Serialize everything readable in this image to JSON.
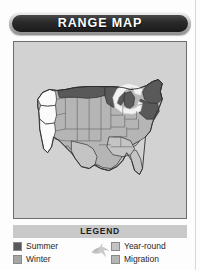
{
  "card": {
    "title": "RANGE MAP"
  },
  "map": {
    "name": "united-states-range-map",
    "background_color": "#d2d2d2",
    "border_color": "#6d6d6d",
    "region_colors": {
      "summer": "#595959",
      "winter": "#fbfbfb",
      "year_round": "#c4c4c4",
      "migration": "#b5b5b5",
      "water": "#f2f2f2",
      "outline": "#2f2f2f"
    },
    "regions": [
      {
        "id": "pacific-northwest-coast",
        "label": "Winter range — Washington, Oregon coast",
        "category": "winter"
      },
      {
        "id": "california-coast",
        "label": "Winter range — California coast",
        "category": "winter"
      },
      {
        "id": "northern-plains",
        "label": "Summer range — Montana, North Dakota, Minnesota",
        "category": "summer"
      },
      {
        "id": "upper-great-lakes",
        "label": "Summer range — Wisconsin, Michigan",
        "category": "summer"
      },
      {
        "id": "northeast",
        "label": "Summer range — New York, Pennsylvania, New England",
        "category": "summer"
      },
      {
        "id": "mid-atlantic",
        "label": "Summer range — New Jersey, Maryland",
        "category": "summer"
      },
      {
        "id": "interior-west",
        "label": "Migration range — interior western states",
        "category": "migration"
      },
      {
        "id": "southern-states",
        "label": "Year-round range — southern states",
        "category": "year_round"
      },
      {
        "id": "great-lakes-water",
        "label": "Great Lakes",
        "category": "water"
      }
    ]
  },
  "legend": {
    "heading": "LEGEND",
    "bird_icon": "flying-bird-icon",
    "items": [
      {
        "label": "Summer",
        "swatch_color": "#595959",
        "icon": "summer-swatch-icon"
      },
      {
        "label": "Winter",
        "swatch_color": "#a6a6a6",
        "icon": "winter-swatch-icon"
      },
      {
        "label": "Year-round",
        "swatch_color": "#c4c4c4",
        "icon": "year-round-swatch-icon"
      },
      {
        "label": "Migration",
        "swatch_color": "#b5b5b5",
        "icon": "migration-swatch-icon"
      }
    ]
  }
}
